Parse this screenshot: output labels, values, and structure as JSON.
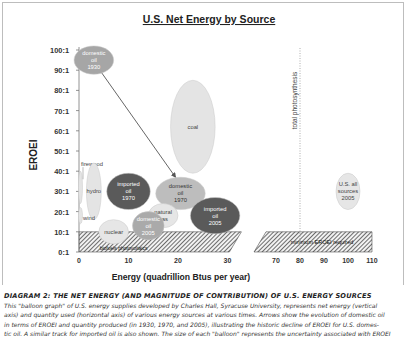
{
  "chart_data": {
    "type": "scatter",
    "subtype": "balloon",
    "title": "U.S. Net Energy by Source",
    "xlabel": "Energy (quadrillion Btus per year)",
    "ylabel": "EROEI",
    "x_axis_break": [
      32,
      65
    ],
    "x_ticks": [
      0,
      10,
      20,
      30,
      70,
      80,
      90,
      100,
      110
    ],
    "x_tick_labels": [
      "0",
      "10",
      "20",
      "30",
      "70",
      "80",
      "90",
      "100",
      "110"
    ],
    "y_ticks": [
      0,
      10,
      20,
      30,
      40,
      50,
      60,
      70,
      80,
      90,
      100
    ],
    "y_tick_labels": [
      "0:1",
      "10:1",
      "20:1",
      "30:1",
      "40:1",
      "50:1",
      "60:1",
      "70:1",
      "80:1",
      "90:1",
      "100:1"
    ],
    "xlim": [
      0,
      110
    ],
    "ylim": [
      0,
      100
    ],
    "grid": false,
    "balloons": [
      {
        "label": [
          "domestic",
          "oil",
          "1930"
        ],
        "x": 3,
        "y": 95,
        "rx": 4,
        "ry": 7,
        "color": "#a6a6a6",
        "text_color": "#ffffff"
      },
      {
        "label": [
          "coal"
        ],
        "x": 23,
        "y": 62,
        "rx": 4.5,
        "ry": 23,
        "color": "#e4e4e4",
        "text_color": "#444444"
      },
      {
        "label": [
          "firewood"
        ],
        "x": 0.3,
        "y": 32,
        "rx": 0.4,
        "ry": 8,
        "color": "#e4e4e4",
        "text_color": "#444444",
        "callout": true
      },
      {
        "label": [
          "hydro"
        ],
        "x": 3,
        "y": 30,
        "rx": 1.5,
        "ry": 14,
        "color": "#e4e4e4",
        "text_color": "#444444"
      },
      {
        "label": [
          "wind"
        ],
        "x": 0.3,
        "y": 18,
        "rx": 0.4,
        "ry": 4,
        "color": "#e4e4e4",
        "text_color": "#444444"
      },
      {
        "label": [
          "imported",
          "oil",
          "1970"
        ],
        "x": 10,
        "y": 30,
        "rx": 4.4,
        "ry": 9,
        "color": "#5a5a5a",
        "text_color": "#ffffff"
      },
      {
        "label": [
          "domestic",
          "oil",
          "1970"
        ],
        "x": 20.5,
        "y": 29,
        "rx": 5,
        "ry": 8,
        "color": "#bdbdbd",
        "text_color": "#333333"
      },
      {
        "label": [
          "natural",
          "gas"
        ],
        "x": 17,
        "y": 18,
        "rx": 3,
        "ry": 6,
        "color": "#e6e6e6",
        "text_color": "#444444"
      },
      {
        "label": [
          "imported",
          "oil",
          "2005"
        ],
        "x": 27.5,
        "y": 18,
        "rx": 5,
        "ry": 9,
        "color": "#5a5a5a",
        "text_color": "#ffffff"
      },
      {
        "label": [
          "domestic",
          "oil",
          "2005"
        ],
        "x": 14,
        "y": 13,
        "rx": 3.2,
        "ry": 7,
        "color": "#aaaaaa",
        "text_color": "#ffffff"
      },
      {
        "label": [
          "nuclear"
        ],
        "x": 7,
        "y": 10,
        "rx": 3,
        "ry": 6,
        "color": "#e6e6e6",
        "text_color": "#444444"
      },
      {
        "label": [
          "U.S. all",
          "sources",
          "2005"
        ],
        "x": 100,
        "y": 30,
        "rx": 5,
        "ry": 9,
        "color": "#e6e6e6",
        "text_color": "#444444"
      }
    ],
    "arrows": [
      {
        "from": [
          4.5,
          89
        ],
        "to": [
          19.5,
          37
        ]
      },
      {
        "from": [
          17.5,
          23
        ],
        "to": [
          14.5,
          19
        ]
      }
    ],
    "hatched_region": {
      "y_from": 0,
      "y_to": 10,
      "label": "minimum EROEI required",
      "label_left": "biofuels photovoltaics"
    },
    "reference_line": {
      "x": 80,
      "label": "total photosynthesis",
      "style": "dotted"
    }
  },
  "caption": {
    "title": "DIAGRAM 2: THE NET ENERGY (AND MAGNITUDE OF CONTRIBUTION) OF U.S. ENERGY SOURCES",
    "lines": [
      "This  \"balloon graph\" of U.S. energy supplies developed by Charles Hall, Syracuse University,  represents net energy (vertical",
      "axis) and quantity used (horizontal axis) of various energy sources at various times. Arrows show the evolution of domestic oil",
      "in terms of EROEI and quantity produced (in 1930, 1970, and 2005), illustrating the historic decline of EROEI for U.S. domes-",
      "tic oil. A similar track for imported oil is also shown. The size of each \"balloon\" represents the uncertainty associated with EROEI"
    ]
  }
}
